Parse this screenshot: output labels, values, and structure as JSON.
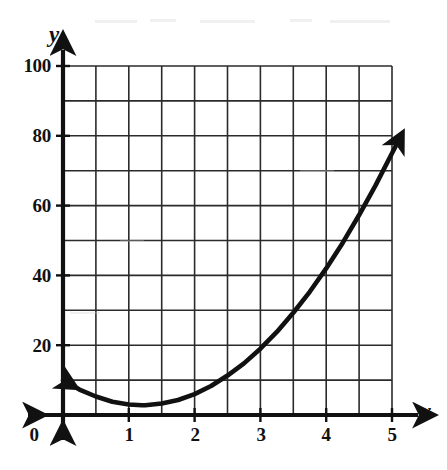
{
  "figure": {
    "background_color": "#ffffff",
    "ink_color": "#111111",
    "grid_color": "#2b2b2b",
    "width": 447,
    "height": 470
  },
  "axes": {
    "x_axis_name": "x",
    "y_axis_name": "y",
    "x_ticks": [
      "0",
      "1",
      "2",
      "3",
      "4",
      "5"
    ],
    "y_ticks": [
      "20",
      "40",
      "60",
      "80",
      "100"
    ],
    "origin_label": "0"
  },
  "chart_data": {
    "type": "line",
    "title": "",
    "xlabel": "x",
    "ylabel": "y",
    "xlim": [
      0,
      5
    ],
    "ylim": [
      0,
      100
    ],
    "grid": true,
    "grid_x_step": 0.5,
    "grid_y_step": 10,
    "x_major_ticks": [
      0,
      1,
      2,
      3,
      4,
      5
    ],
    "y_major_ticks": [
      0,
      20,
      40,
      60,
      80,
      100
    ],
    "x_minor_ticks": [
      0.5,
      1.5,
      2.5,
      3.5,
      4.5
    ],
    "y_minor_ticks": [
      10,
      30,
      50,
      70,
      90
    ],
    "legend": "none",
    "series": [
      {
        "name": "parabola",
        "formula": "y = 5x^2 - 12x + 10",
        "arrow_start": true,
        "arrow_end": true,
        "x": [
          0,
          0.25,
          0.5,
          0.75,
          1,
          1.2,
          1.25,
          1.5,
          1.75,
          2,
          2.25,
          2.5,
          2.75,
          3,
          3.25,
          3.5,
          3.75,
          4,
          4.25,
          4.5,
          4.75,
          5
        ],
        "values": [
          10,
          7.3,
          5.3,
          3.8,
          3,
          2.8,
          2.8,
          3.3,
          4.3,
          6,
          8.3,
          11.3,
          14.8,
          19,
          23.8,
          29.3,
          35.3,
          42,
          49.3,
          57.3,
          65.8,
          75
        ]
      }
    ],
    "annotations": [
      {
        "text": "vertex",
        "x": 1.2,
        "y": 2.8
      },
      {
        "text": "y-intercept",
        "x": 0,
        "y": 10
      }
    ]
  }
}
